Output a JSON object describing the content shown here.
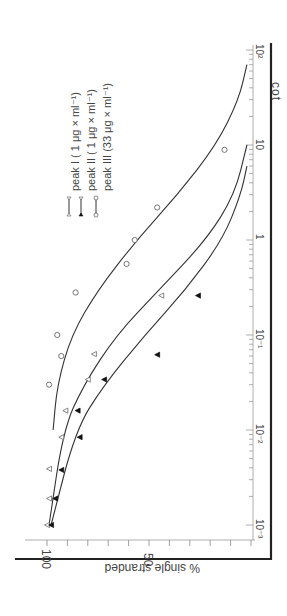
{
  "chart_data": {
    "type": "scatter",
    "orientation": "rotated-90-clockwise",
    "title": "",
    "xlabel": "cot",
    "ylabel": "% single stranded",
    "xscale": "log",
    "xlim": [
      0.001,
      100
    ],
    "ylim": [
      0,
      100
    ],
    "x_tick_labels": [
      "10⁻³",
      "10⁻²",
      "10⁻¹",
      "1",
      "10",
      "10²"
    ],
    "x_ticks": [
      0.001,
      0.01,
      0.1,
      1,
      10,
      100
    ],
    "y_tick_labels": [
      "100",
      "50"
    ],
    "y_ticks": [
      100,
      50
    ],
    "grid": false,
    "legend_position": "upper-left (rotated)",
    "series": [
      {
        "name": "peak I (1 μg × ml⁻¹)",
        "marker": "open-triangle",
        "x": [
          0.001,
          0.0019,
          0.0039,
          0.0084,
          0.016,
          0.034,
          0.063,
          0.26
        ],
        "y": [
          100,
          99,
          99,
          93,
          91,
          80,
          77,
          44
        ],
        "curve": {
          "x": [
            0.001,
            0.01,
            0.03,
            0.1,
            0.3,
            1,
            3,
            10
          ],
          "y": [
            99,
            92,
            82,
            66,
            45,
            22,
            8,
            2
          ]
        }
      },
      {
        "name": "peak II (1 μg × ml⁻¹)",
        "marker": "filled-triangle",
        "x": [
          0.001,
          0.0019,
          0.0038,
          0.0084,
          0.016,
          0.034,
          0.062,
          0.26
        ],
        "y": [
          98,
          96,
          93,
          84,
          85,
          72,
          46,
          26
        ],
        "curve": {
          "x": [
            0.001,
            0.01,
            0.03,
            0.1,
            0.3,
            1,
            3,
            6
          ],
          "y": [
            98,
            86,
            72,
            52,
            32,
            14,
            5,
            2
          ]
        }
      },
      {
        "name": "peak III (33 μg × ml⁻¹)",
        "marker": "open-circle",
        "x": [
          0.03,
          0.06,
          0.1,
          0.28,
          0.56,
          1,
          2.2,
          8.9
        ],
        "y": [
          99,
          93,
          95,
          86,
          61,
          57,
          46,
          13
        ],
        "curve": {
          "x": [
            0.01,
            0.03,
            0.1,
            0.3,
            1,
            3,
            10,
            30,
            70
          ],
          "y": [
            97,
            95,
            88,
            75,
            56,
            36,
            17,
            6,
            2
          ]
        }
      }
    ]
  },
  "legend": {
    "items": [
      {
        "label": "peak  I   ( 1  μg × ml⁻¹)"
      },
      {
        "label": "peak  II  ( 1  μg × ml⁻¹)"
      },
      {
        "label": "peak  III (33 μg × ml⁻¹)"
      }
    ]
  },
  "axes": {
    "x_title": "cot",
    "y_title": "% single stranded",
    "y_100": "100",
    "y_50": "50"
  },
  "colors": {
    "ink": "#333333",
    "marker": "#555555",
    "axis": "#222222"
  }
}
